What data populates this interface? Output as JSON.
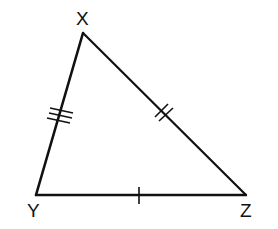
{
  "diagram": {
    "type": "triangle",
    "stroke_color": "#111111",
    "background": "#ffffff",
    "vertices": [
      {
        "name": "X",
        "x": 83,
        "y": 33
      },
      {
        "name": "Y",
        "x": 36,
        "y": 195
      },
      {
        "name": "Z",
        "x": 246,
        "y": 195
      }
    ],
    "labels": {
      "X": "X",
      "Y": "Y",
      "Z": "Z"
    },
    "sides": [
      {
        "name": "XY",
        "tick_marks": 3
      },
      {
        "name": "XZ",
        "tick_marks": 2
      },
      {
        "name": "YZ",
        "tick_marks": 1
      }
    ]
  }
}
